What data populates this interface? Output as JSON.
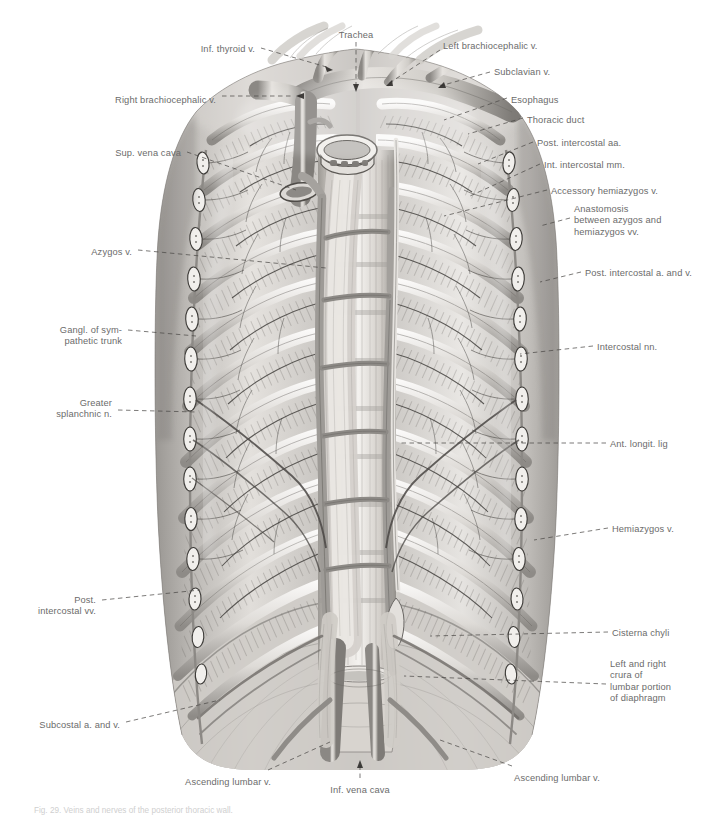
{
  "figure": {
    "style": "grayscale anatomical atlas illustration, pencil/wash rendering",
    "caption": "Fig. 29. Veins and nerves of the posterior thoracic wall."
  },
  "labels": {
    "top": [
      {
        "id": "trachea",
        "text": "Trachea",
        "align": "c",
        "x": 356,
        "y": 30,
        "leader": "vertical"
      },
      {
        "id": "inf-thyroid-v",
        "text": "Inf. thyroid v.",
        "align": "r",
        "x": 255,
        "y": 44,
        "leader": "dash"
      },
      {
        "id": "left-brachiocephalic-v",
        "text": "Left brachiocephalic v.",
        "align": "l",
        "x": 443,
        "y": 41,
        "leader": "dash"
      },
      {
        "id": "subclavian-v",
        "text": "Subclavian v.",
        "align": "l",
        "x": 494,
        "y": 67,
        "leader": "dash"
      },
      {
        "id": "right-brachiocephalic-v",
        "text": "Right brachiocephalic v.",
        "align": "r",
        "x": 216,
        "y": 95,
        "leader": "dash"
      },
      {
        "id": "esophagus",
        "text": "Esophagus",
        "align": "l",
        "x": 511,
        "y": 95,
        "leader": "dash"
      },
      {
        "id": "thoracic-duct",
        "text": "Thoracic duct",
        "align": "l",
        "x": 527,
        "y": 115,
        "leader": "dash"
      },
      {
        "id": "sup-vena-cava",
        "text": "Sup. vena cava",
        "align": "r",
        "x": 181,
        "y": 148,
        "leader": "dash"
      },
      {
        "id": "post-intercostal-aa",
        "text": "Post. intercostal aa.",
        "align": "l",
        "x": 537,
        "y": 138,
        "leader": "dash"
      },
      {
        "id": "int-intercostal-mm",
        "text": "Int. intercostal mm.",
        "align": "l",
        "x": 544,
        "y": 160,
        "leader": "dash"
      },
      {
        "id": "accessory-hemiazygos-v",
        "text": "Accessory hemiazygos v.",
        "align": "l",
        "x": 551,
        "y": 186,
        "leader": "dash"
      }
    ],
    "right": [
      {
        "id": "anastomosis-azygos-hemiazygos",
        "text": "Anastomosis\nbetween azygos and\nhemiazygos vv.",
        "align": "l",
        "x": 574,
        "y": 204,
        "leader": "dash"
      },
      {
        "id": "post-intercostal-a-and-v",
        "text": "Post. intercostal a. and v.",
        "align": "l",
        "x": 585,
        "y": 268,
        "leader": "dash"
      },
      {
        "id": "intercostal-nn",
        "text": "Intercostal nn.",
        "align": "l",
        "x": 597,
        "y": 342,
        "leader": "dash"
      },
      {
        "id": "ant-longit-lig",
        "text": "Ant. longit. lig",
        "align": "l",
        "x": 610,
        "y": 439,
        "leader": "dash"
      },
      {
        "id": "hemiazygos-v",
        "text": "Hemiazygos v.",
        "align": "l",
        "x": 612,
        "y": 524,
        "leader": "dash"
      },
      {
        "id": "cisterna-chyli",
        "text": "Cisterna chyli",
        "align": "l",
        "x": 612,
        "y": 628,
        "leader": "dash"
      },
      {
        "id": "crura-of-diaphragm",
        "text": "Left and right\ncrura of\nlumbar portion\nof diaphragm",
        "align": "l",
        "x": 610,
        "y": 659,
        "leader": "dash"
      }
    ],
    "left": [
      {
        "id": "azygos-v",
        "text": "Azygos v.",
        "align": "r",
        "x": 132,
        "y": 247,
        "leader": "dash"
      },
      {
        "id": "gangl-sympathetic-trunk",
        "text": "Gangl. of sym-\npathetic trunk",
        "align": "r",
        "x": 122,
        "y": 325,
        "leader": "dash"
      },
      {
        "id": "greater-splanchnic-n",
        "text": "Greater\nsplanchnic n.",
        "align": "r",
        "x": 112,
        "y": 398,
        "leader": "dash"
      },
      {
        "id": "post-intercostal-vv",
        "text": "Post.\nintercostal vv.",
        "align": "r",
        "x": 96,
        "y": 595,
        "leader": "dash"
      },
      {
        "id": "subcostal-a-and-v",
        "text": "Subcostal a. and v.",
        "align": "r",
        "x": 120,
        "y": 720,
        "leader": "dash"
      }
    ],
    "bottom": [
      {
        "id": "ascending-lumbar-v-left",
        "text": "Ascending lumbar v.",
        "align": "c",
        "x": 228,
        "y": 777,
        "leader": "dash"
      },
      {
        "id": "inf-vena-cava",
        "text": "Inf. vena cava",
        "align": "c",
        "x": 360,
        "y": 785,
        "leader": "vertical"
      },
      {
        "id": "ascending-lumbar-v-right",
        "text": "Ascending lumbar v.",
        "align": "c",
        "x": 557,
        "y": 773,
        "leader": "dash"
      }
    ]
  },
  "colors": {
    "background": "#ffffff",
    "label_text": "#6b6b6b",
    "leader_line": "#555555",
    "caption_text": "#cfcfcf",
    "illustration_light": "#f2f0ee",
    "illustration_mid": "#b7b4b0",
    "illustration_dark": "#4a4845"
  }
}
